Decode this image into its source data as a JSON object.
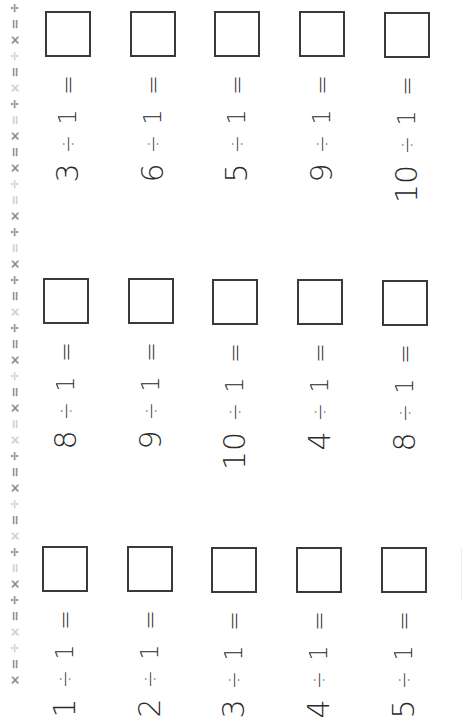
{
  "worksheet": {
    "type": "division worksheet (dividing by 1)",
    "orientation": "rotated 90° counter-clockwise",
    "operator_symbol": "÷",
    "divisor": "1",
    "equals_symbol": "=",
    "sections": [
      {
        "name": "section-top",
        "problems": [
          {
            "dividend": "3",
            "divisor": "1",
            "answer": ""
          },
          {
            "dividend": "6",
            "divisor": "1",
            "answer": ""
          },
          {
            "dividend": "5",
            "divisor": "1",
            "answer": ""
          },
          {
            "dividend": "9",
            "divisor": "1",
            "answer": ""
          },
          {
            "dividend": "10",
            "divisor": "1",
            "answer": ""
          }
        ]
      },
      {
        "name": "section-middle",
        "problems": [
          {
            "dividend": "8",
            "divisor": "1",
            "answer": ""
          },
          {
            "dividend": "9",
            "divisor": "1",
            "answer": ""
          },
          {
            "dividend": "10",
            "divisor": "1",
            "answer": ""
          },
          {
            "dividend": "4",
            "divisor": "1",
            "answer": ""
          },
          {
            "dividend": "8",
            "divisor": "1",
            "answer": ""
          }
        ]
      },
      {
        "name": "section-bottom",
        "problems": [
          {
            "dividend": "1",
            "divisor": "1",
            "answer": ""
          },
          {
            "dividend": "2",
            "divisor": "1",
            "answer": ""
          },
          {
            "dividend": "3",
            "divisor": "1",
            "answer": ""
          },
          {
            "dividend": "4",
            "divisor": "1",
            "answer": ""
          },
          {
            "dividend": "5",
            "divisor": "1",
            "answer": ""
          }
        ]
      }
    ]
  },
  "border": {
    "symbols": [
      "÷",
      "=",
      "×",
      "÷",
      "=",
      "×",
      "÷",
      "=",
      "×",
      "=",
      "×",
      "÷",
      "=",
      "×",
      "÷",
      "=",
      "×",
      "÷",
      "=",
      "×",
      "÷",
      "=",
      "×",
      "÷",
      "=",
      "×",
      "=",
      "×",
      "÷",
      "=",
      "×",
      "÷",
      "=",
      "×",
      "÷",
      "=",
      "×",
      "÷",
      "=",
      "×",
      "÷",
      "=",
      "×"
    ],
    "colors": {
      "dark": "#8a8a8a",
      "light": "#cfcfcf"
    }
  },
  "colors": {
    "background": "#ffffff",
    "ink": "#2a2a2a",
    "box_border": "#3a3a3a"
  }
}
